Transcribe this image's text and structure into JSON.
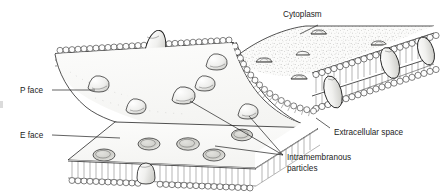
{
  "figure": {
    "background_color": "#ffffff",
    "ink_color": "#1a1a1a",
    "width": 441,
    "height": 196
  },
  "labels": {
    "cytoplasm": "Cytoplasm",
    "p_face": "P face",
    "e_face": "E face",
    "extracellular_space": "Extracellular space",
    "intramembranous_particles_line1": "Intramembranous",
    "intramembranous_particles_line2": "particles"
  },
  "structures": {
    "p_face_particles": {
      "name": "P face particles",
      "count": 6,
      "shape": "rounded-cone",
      "description": "Raised cone-shaped intramembranous particles on the protoplasmic fracture face"
    },
    "e_face_pits": {
      "name": "E face pits",
      "count": 5,
      "shape": "oval-depression",
      "description": "Oval depressions left on the extracellular fracture face"
    },
    "cytoplasm_surface_domes": {
      "name": "Cytoplasmic surface domes",
      "count": 6,
      "shape": "dome",
      "description": "Membrane proteins bulging from the cytoplasmic surface"
    },
    "transmembrane_proteins": {
      "name": "Transmembrane proteins",
      "count": 4,
      "shape": "ellipse",
      "description": "Integral proteins spanning the phospholipid bilayer at cut edges"
    },
    "bilayer": {
      "name": "Phospholipid bilayer",
      "leaflets": 2,
      "head_shape": "circle",
      "tail_shape": "line"
    }
  },
  "leader_lines": {
    "cytoplasm": "from Cytoplasm label down-left to the cytoplasmic surface",
    "p_face": "from P face label right to the P fracture face",
    "e_face": "from E face label right to the E fracture face",
    "extracellular_space": "from Extracellular space label up-left to the bilayer gap",
    "intramembranous_particles": "three lines fanning up-left to P face particles and E face pits"
  }
}
